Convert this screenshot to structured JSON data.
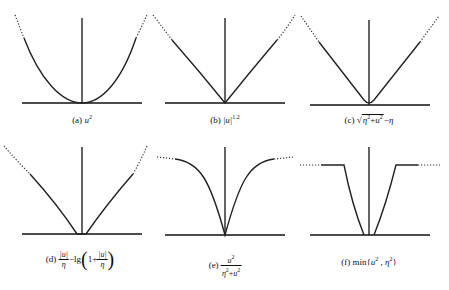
{
  "figure": {
    "panels": [
      {
        "id": "a",
        "tag": "(a)",
        "function": "u^2",
        "shape": "parabola"
      },
      {
        "id": "b",
        "tag": "(b)",
        "function": "|u|^1.2",
        "shape": "power-1.2"
      },
      {
        "id": "c",
        "tag": "(c)",
        "function": "sqrt(eta^2+u^2) - eta",
        "shape": "hyperbolic"
      },
      {
        "id": "d",
        "tag": "(d)",
        "function": "|u|/eta - lg(1 + |u|/eta)",
        "shape": "log-penalty"
      },
      {
        "id": "e",
        "tag": "(e)",
        "function": "u^2/(eta^2+u^2)",
        "shape": "saturating"
      },
      {
        "id": "f",
        "tag": "(f)",
        "function": "min{u^2, eta^2}",
        "shape": "truncated-quadratic"
      }
    ],
    "labels": {
      "a": {
        "tag": "(a)",
        "var": "u",
        "exp": "2"
      },
      "b": {
        "tag": "(b)",
        "abs_var": "|u|",
        "exp": "1.2"
      },
      "c": {
        "tag": "(c)",
        "sqrt_sym": "√",
        "inner_eta": "η",
        "inner_u": "u",
        "exp": "2",
        "plus": "+",
        "minus": "−",
        "tail_eta": "η"
      },
      "d": {
        "tag": "(d)",
        "num": "|u|",
        "den": "η",
        "minus_lg": "−lg",
        "one_plus": "1+",
        "lparen": "(",
        "rparen": ")"
      },
      "e": {
        "tag": "(e)",
        "num_var": "u",
        "den_eta": "η",
        "den_u": "u",
        "exp": "2",
        "plus": "+"
      },
      "f": {
        "tag": "(f)",
        "text": "min{",
        "var": "u",
        "sep": " , ",
        "eta": "η",
        "exp": "2",
        "close": "}"
      }
    }
  }
}
